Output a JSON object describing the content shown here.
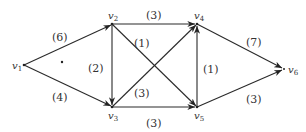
{
  "diagram": {
    "type": "directed weighted graph",
    "nodes": [
      {
        "id": "v1",
        "name": "v",
        "sub": "1",
        "x": 24,
        "y": 65
      },
      {
        "id": "v2",
        "name": "v",
        "sub": "2",
        "x": 112,
        "y": 24
      },
      {
        "id": "v3",
        "name": "v",
        "sub": "3",
        "x": 112,
        "y": 107
      },
      {
        "id": "v4",
        "name": "v",
        "sub": "4",
        "x": 197,
        "y": 24
      },
      {
        "id": "v5",
        "name": "v",
        "sub": "5",
        "x": 197,
        "y": 107
      },
      {
        "id": "v6",
        "name": "v",
        "sub": "6",
        "x": 284,
        "y": 69
      }
    ],
    "edges": [
      {
        "from": "v1",
        "to": "v2",
        "label": "(6)"
      },
      {
        "from": "v1",
        "to": "v3",
        "label": "(4)"
      },
      {
        "from": "v2",
        "to": "v3",
        "label": "(2)"
      },
      {
        "from": "v2",
        "to": "v4",
        "label": "(3)"
      },
      {
        "from": "v2",
        "to": "v5",
        "label": "(1)"
      },
      {
        "from": "v3",
        "to": "v4",
        "label": "(3)"
      },
      {
        "from": "v3",
        "to": "v5",
        "label": "(3)"
      },
      {
        "from": "v5",
        "to": "v4",
        "label": "(1)"
      },
      {
        "from": "v4",
        "to": "v6",
        "label": "(7)"
      },
      {
        "from": "v5",
        "to": "v6",
        "label": "(3)"
      }
    ],
    "stray_dot": {
      "x": 62,
      "y": 62
    }
  }
}
